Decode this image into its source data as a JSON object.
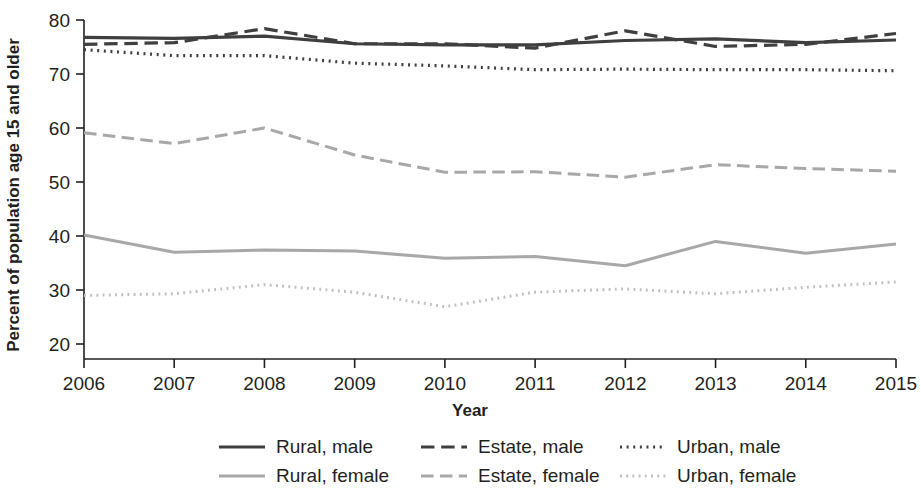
{
  "chart_data": {
    "type": "line",
    "title": "",
    "xlabel": "Year",
    "ylabel": "Percent of population age 15 and older",
    "x": [
      2006,
      2007,
      2008,
      2009,
      2010,
      2011,
      2012,
      2013,
      2014,
      2015
    ],
    "xtick_labels": [
      "2006",
      "2007",
      "2008",
      "2009",
      "2010",
      "2011",
      "2012",
      "2013",
      "2014",
      "2015"
    ],
    "ytick_labels": [
      "20",
      "30",
      "40",
      "50",
      "60",
      "70",
      "80"
    ],
    "ytick_values": [
      20,
      30,
      40,
      50,
      60,
      70,
      80
    ],
    "xlim": [
      2006,
      2015
    ],
    "ylim": [
      18,
      80
    ],
    "grid": false,
    "legend_position": "bottom",
    "series": [
      {
        "name": "Rural, male",
        "key": "rural_male",
        "style": "solid",
        "color": "#3f3f3f",
        "width": 3.2,
        "values": [
          76.8,
          76.6,
          77.0,
          75.6,
          75.4,
          75.4,
          76.2,
          76.5,
          75.8,
          76.3
        ]
      },
      {
        "name": "Estate, male",
        "key": "estate_male",
        "style": "dashed",
        "color": "#3f3f3f",
        "width": 3.2,
        "values": [
          75.5,
          75.8,
          78.4,
          75.6,
          75.6,
          74.8,
          78.0,
          75.1,
          75.5,
          77.5
        ]
      },
      {
        "name": "Urban, male",
        "key": "urban_male",
        "style": "dotted",
        "color": "#3f3f3f",
        "width": 3.2,
        "values": [
          74.5,
          73.4,
          73.4,
          72.0,
          71.5,
          70.8,
          70.9,
          70.8,
          70.8,
          70.6
        ]
      },
      {
        "name": "Rural, female",
        "key": "rural_female",
        "style": "solid",
        "color": "#a8a8a8",
        "width": 3.0,
        "values": [
          40.2,
          37.0,
          37.4,
          37.2,
          35.9,
          36.2,
          34.5,
          39.0,
          36.8,
          38.5
        ]
      },
      {
        "name": "Estate, female",
        "key": "estate_female",
        "style": "dashed",
        "color": "#a8a8a8",
        "width": 3.0,
        "values": [
          59.1,
          57.1,
          60.0,
          55.0,
          51.8,
          51.9,
          50.9,
          53.2,
          52.5,
          52.0
        ]
      },
      {
        "name": "Urban, female",
        "key": "urban_female",
        "style": "dotted",
        "color": "#bfbfbf",
        "width": 3.0,
        "values": [
          29.0,
          29.3,
          31.0,
          29.6,
          26.9,
          29.6,
          30.2,
          29.3,
          30.5,
          31.5
        ]
      }
    ],
    "legend_rows": [
      [
        "Rural, male",
        "Estate, male",
        "Urban, male"
      ],
      [
        "Rural, female",
        "Estate, female",
        "Urban, female"
      ]
    ]
  },
  "axis": {
    "y_title": "Percent of population age 15 and older",
    "x_title": "Year"
  }
}
